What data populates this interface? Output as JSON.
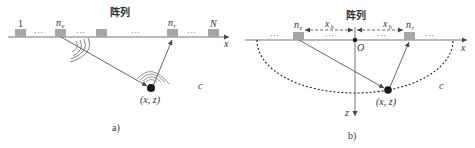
{
  "colors": {
    "element_fill": "#a6a6a6",
    "line": "#555555",
    "dark": "#1a1a1a",
    "text": "#333333"
  },
  "panel_a": {
    "title": "阵列",
    "element_labels": {
      "first": "1",
      "emitter": "n",
      "emitter_sub": "e",
      "receiver": "n",
      "receiver_sub": "r",
      "last": "N"
    },
    "ellipsis": "···",
    "x_axis_label": "x",
    "source_label": "(x, z)",
    "medium_label": "c",
    "caption": "a)"
  },
  "panel_b": {
    "title": "阵列",
    "element_labels": {
      "emitter": "n",
      "emitter_sub": "e",
      "receiver": "n",
      "receiver_sub": "r"
    },
    "half_offset_label": "x",
    "half_offset_sub": "h",
    "ellipsis": "···",
    "origin_label": "O",
    "x_axis_label": "x",
    "z_axis_label": "z",
    "source_label": "(x, z)",
    "medium_label": "c",
    "caption": "b)"
  }
}
